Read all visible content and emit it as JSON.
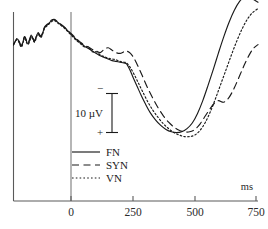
{
  "chart_data": {
    "type": "line",
    "title": "",
    "xlabel": "ms",
    "ylabel": "",
    "xlim": [
      -180,
      750
    ],
    "ylim": [
      -30,
      20
    ],
    "xticks": [
      0,
      250,
      500,
      750
    ],
    "xtick_labels": [
      "0",
      "250",
      "500",
      "750"
    ],
    "grid": false,
    "legend_position": "center-left",
    "polarity": {
      "negative_symbol": "−",
      "positive_symbol": "+",
      "note": "negative plotted upward"
    },
    "scale_bar": {
      "label": "10 µV",
      "value": 10,
      "units": "µV"
    },
    "series": [
      {
        "name": "FN",
        "style": "solid",
        "color": "#1a1a1a",
        "x": [
          -180,
          -165,
          -150,
          -138,
          -125,
          -112,
          -100,
          -88,
          -75,
          -62,
          -50,
          -38,
          -25,
          -12,
          0,
          15,
          30,
          45,
          60,
          75,
          90,
          105,
          120,
          135,
          150,
          165,
          180,
          195,
          210,
          225,
          240,
          250,
          262,
          275,
          290,
          305,
          320,
          340,
          360,
          380,
          400,
          420,
          440,
          460,
          480,
          500,
          520,
          540,
          560,
          580,
          600,
          620,
          640,
          660,
          680,
          700,
          720,
          735,
          750
        ],
        "y": [
          2.5,
          1.0,
          2.8,
          0.6,
          2.2,
          0.2,
          1.6,
          -0.4,
          0.4,
          -1.8,
          -2.6,
          -3.4,
          -3.8,
          -3.2,
          -2.6,
          -1.8,
          -0.8,
          0.2,
          1.2,
          2.0,
          2.8,
          3.4,
          4.0,
          4.6,
          5.2,
          5.6,
          6.0,
          6.4,
          6.6,
          6.8,
          7.0,
          7.2,
          8.6,
          10.6,
          12.8,
          15.0,
          17.0,
          19.4,
          21.2,
          22.6,
          23.6,
          24.2,
          24.4,
          24.2,
          23.4,
          22.0,
          19.6,
          16.4,
          12.6,
          8.6,
          4.4,
          0.4,
          -3.2,
          -6.2,
          -8.4,
          -9.6,
          -9.4,
          -8.8,
          -8.2
        ]
      },
      {
        "name": "SYN",
        "style": "dashed",
        "color": "#1a1a1a",
        "x": [
          -180,
          -165,
          -150,
          -138,
          -125,
          -112,
          -100,
          -88,
          -75,
          -62,
          -50,
          -38,
          -25,
          -12,
          0,
          15,
          30,
          45,
          60,
          75,
          90,
          105,
          120,
          135,
          150,
          165,
          180,
          195,
          210,
          225,
          240,
          250,
          265,
          280,
          295,
          310,
          330,
          350,
          370,
          390,
          410,
          430,
          450,
          470,
          490,
          510,
          530,
          550,
          570,
          585,
          600,
          620,
          640,
          660,
          680,
          700,
          720,
          735,
          750
        ],
        "y": [
          2.5,
          0.8,
          2.6,
          0.4,
          2.0,
          0.0,
          1.4,
          -0.6,
          0.2,
          -2.0,
          -2.8,
          -3.6,
          -3.9,
          -3.3,
          -2.7,
          -1.9,
          -0.9,
          0.0,
          1.0,
          1.8,
          2.6,
          3.0,
          3.6,
          4.0,
          4.4,
          3.6,
          3.2,
          3.8,
          4.4,
          4.6,
          4.2,
          4.0,
          4.6,
          6.0,
          8.0,
          10.2,
          13.2,
          15.8,
          18.2,
          20.2,
          21.8,
          23.0,
          23.8,
          24.2,
          24.2,
          23.6,
          22.2,
          20.2,
          18.2,
          17.0,
          16.4,
          16.8,
          15.6,
          13.2,
          10.2,
          7.2,
          4.6,
          3.2,
          2.4
        ]
      },
      {
        "name": "VN",
        "style": "dotted",
        "color": "#1a1a1a",
        "x": [
          -180,
          -165,
          -150,
          -138,
          -125,
          -112,
          -100,
          -88,
          -75,
          -62,
          -50,
          -38,
          -25,
          -12,
          0,
          15,
          30,
          45,
          60,
          75,
          90,
          105,
          120,
          135,
          150,
          165,
          180,
          195,
          210,
          225,
          240,
          250,
          265,
          280,
          295,
          310,
          330,
          350,
          370,
          390,
          410,
          430,
          450,
          470,
          490,
          510,
          530,
          550,
          570,
          590,
          610,
          630,
          650,
          670,
          690,
          710,
          730,
          750
        ],
        "y": [
          2.2,
          1.2,
          3.0,
          1.0,
          2.4,
          0.6,
          1.8,
          -0.2,
          0.6,
          -1.6,
          -2.4,
          -3.2,
          -3.6,
          -3.0,
          -2.4,
          -1.6,
          -0.6,
          0.4,
          1.4,
          2.2,
          3.0,
          3.0,
          4.2,
          4.2,
          5.0,
          5.4,
          5.8,
          6.0,
          6.2,
          6.6,
          6.8,
          7.0,
          8.2,
          10.0,
          12.0,
          14.0,
          16.6,
          18.8,
          20.6,
          22.2,
          23.4,
          24.4,
          25.0,
          25.4,
          25.4,
          25.0,
          23.8,
          21.8,
          19.0,
          15.6,
          12.0,
          8.4,
          4.8,
          1.4,
          -1.6,
          -4.0,
          -5.6,
          -6.6
        ]
      }
    ],
    "legend": [
      {
        "label": "FN",
        "style": "solid"
      },
      {
        "label": "SYN",
        "style": "dashed"
      },
      {
        "label": "VN",
        "style": "dotted"
      }
    ]
  }
}
